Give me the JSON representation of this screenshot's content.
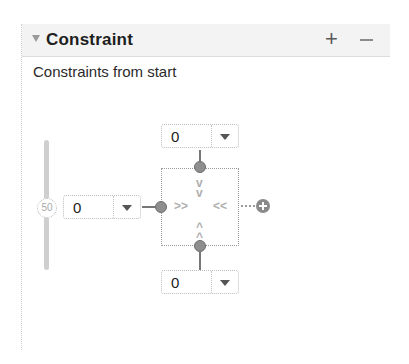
{
  "panel": {
    "title": "Constraint",
    "add_label": "+",
    "remove_label": "−",
    "subtitle": "Constraints from start"
  },
  "constraints": {
    "top_margin": "0",
    "start_margin": "0",
    "bottom_margin": "0"
  },
  "bias_slider": {
    "value": "50",
    "orientation": "vertical"
  },
  "icons": {
    "disclosure": "disclosure-triangle-icon",
    "add": "plus-icon",
    "remove": "minus-icon",
    "add_constraint": "plus-circle-icon"
  },
  "chevrons": {
    "down": "⌄",
    "up": "⌃",
    "right": "››",
    "left": "‹‹"
  },
  "colors": {
    "header_bg": "#f3f3f3",
    "anchor": "#8e8e8e",
    "slider_track": "#cfcfcf"
  }
}
